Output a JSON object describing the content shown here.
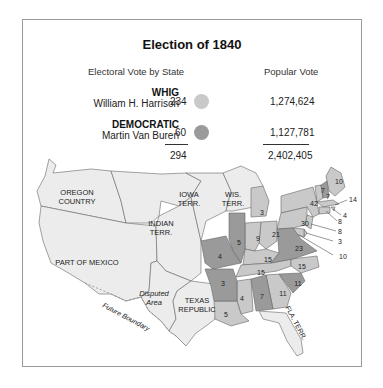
{
  "title": "Election of 1840",
  "legend": {
    "electoral_header": "Electoral Vote by State",
    "popular_header": "Popular Vote",
    "parties": [
      {
        "party": "WHIG",
        "candidate": "William H. Harrison",
        "electoral": "234",
        "popular": "1,274,624",
        "color": "#c9c9c9"
      },
      {
        "party": "DEMOCRATIC",
        "candidate": "Martin Van Buren",
        "electoral": "60",
        "popular": "1,127,781",
        "color": "#9a9a9a"
      }
    ],
    "electoral_total": "294",
    "popular_total": "2,402,405"
  },
  "map": {
    "territory_labels": {
      "oregon": [
        "OREGON",
        "COUNTRY"
      ],
      "iowa": [
        "IOWA",
        "TERR."
      ],
      "wis": [
        "WIS.",
        "TERR."
      ],
      "indian": [
        "INDIAN",
        "TERR."
      ],
      "mexico": "PART OF MEXICO",
      "disputed": [
        "Disputed",
        "Area"
      ],
      "texas": [
        "TEXAS",
        "REPUBLIC"
      ],
      "fla": "FLA. TERR.",
      "future_boundary": "Future Boundary"
    },
    "state_votes": {
      "maine": "10",
      "vermont": "7",
      "new_hampshire": "7",
      "massachusetts": "14",
      "rhode_island": "4",
      "connecticut": "8",
      "new_jersey": "8",
      "delaware": "3",
      "maryland": "10",
      "new_york": "42",
      "pennsylvania": "30",
      "virginia": "23",
      "michigan": "3",
      "ohio": "21",
      "indiana": "9",
      "illinois": "5",
      "missouri": "4",
      "kentucky": "15",
      "tennessee": "15",
      "north_carolina": "15",
      "south_carolina": "11",
      "georgia": "11",
      "alabama": "7",
      "mississippi": "4",
      "louisiana": "5",
      "arkansas": "3"
    },
    "colors": {
      "territory": "#ececec",
      "whig": "#c9c9c9",
      "democratic": "#9a9a9a",
      "border": "#666666",
      "water": "#ffffff"
    }
  }
}
